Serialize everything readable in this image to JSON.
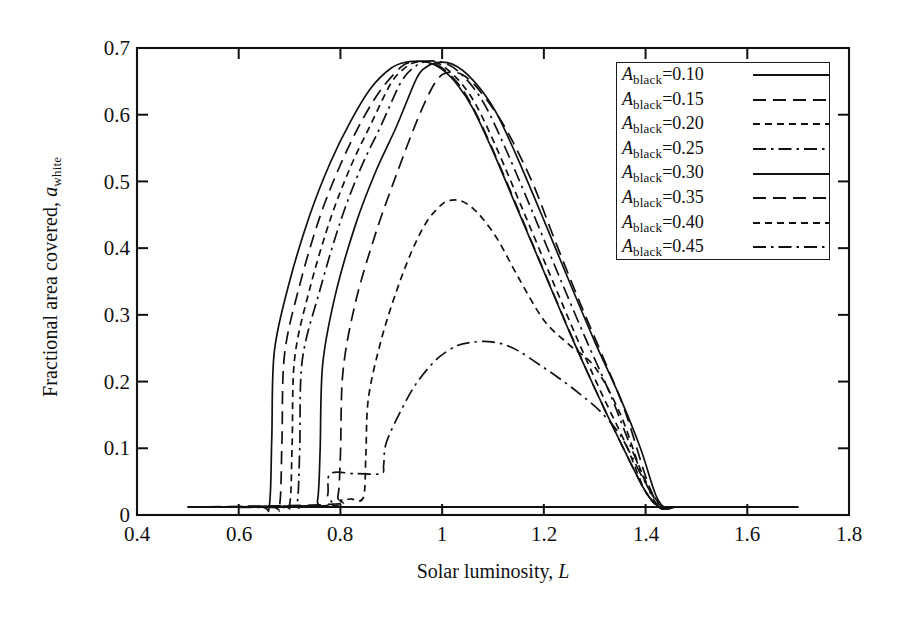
{
  "figure": {
    "background": "#ffffff",
    "ink": "#111111"
  },
  "axes": {
    "x": {
      "label_text": "Solar luminosity, ",
      "label_var": "L",
      "ticks": [
        "0.4",
        "0.6",
        "0.8",
        "1",
        "1.2",
        "1.4",
        "1.6",
        "1.8"
      ],
      "tick_values": [
        0.4,
        0.6,
        0.8,
        1.0,
        1.2,
        1.4,
        1.6,
        1.8
      ],
      "min": 0.4,
      "max": 1.8
    },
    "y": {
      "label_text": "Fractional area covered, ",
      "label_var": "a",
      "label_sub": "white",
      "ticks": [
        "0.7",
        "0.6",
        "0.5",
        "0.4",
        "0.3",
        "0.2",
        "0.1",
        "0"
      ],
      "tick_values": [
        0.7,
        0.6,
        0.5,
        0.4,
        0.3,
        0.2,
        0.1,
        0.0
      ],
      "min": 0.0,
      "max": 0.7
    }
  },
  "legend": {
    "position": "top-right-inside",
    "items": [
      {
        "prefix": "A",
        "sub": "black",
        "eq": "=0.10",
        "dash": "solid"
      },
      {
        "prefix": "A",
        "sub": "black",
        "eq": "=0.15",
        "dash": "dashed"
      },
      {
        "prefix": "A",
        "sub": "black",
        "eq": "=0.20",
        "dash": "dotted-dash"
      },
      {
        "prefix": "A",
        "sub": "black",
        "eq": "=0.25",
        "dash": "dash-dot"
      },
      {
        "prefix": "A",
        "sub": "black",
        "eq": "=0.30",
        "dash": "solid"
      },
      {
        "prefix": "A",
        "sub": "black",
        "eq": "=0.35",
        "dash": "dashed"
      },
      {
        "prefix": "A",
        "sub": "black",
        "eq": "=0.40",
        "dash": "dotted-dash"
      },
      {
        "prefix": "A",
        "sub": "black",
        "eq": "=0.45",
        "dash": "dash-dot"
      }
    ]
  },
  "chart_data": {
    "type": "line",
    "title": "",
    "xlabel": "Solar luminosity, L",
    "ylabel": "Fractional area covered, a_white",
    "xlim": [
      0.4,
      1.8
    ],
    "ylim": [
      0.0,
      0.7
    ],
    "grid": false,
    "legend_position": "upper right",
    "x_ticks": [
      0.4,
      0.6,
      0.8,
      1.0,
      1.2,
      1.4,
      1.6,
      1.8
    ],
    "y_ticks": [
      0.0,
      0.1,
      0.2,
      0.3,
      0.4,
      0.5,
      0.6,
      0.7
    ],
    "series": [
      {
        "name": "A_black=0.10",
        "dash": "solid",
        "x": [
          0.5,
          0.64,
          0.66,
          0.665,
          0.67,
          0.7,
          0.74,
          0.78,
          0.82,
          0.86,
          0.9,
          0.93,
          0.95,
          0.97,
          1.0,
          1.03,
          1.06,
          1.1,
          1.15,
          1.2,
          1.25,
          1.3,
          1.35,
          1.4,
          1.43,
          1.45,
          1.5,
          1.6,
          1.7
        ],
        "y": [
          0.012,
          0.012,
          0.013,
          0.115,
          0.245,
          0.35,
          0.45,
          0.528,
          0.59,
          0.64,
          0.67,
          0.679,
          0.68,
          0.679,
          0.668,
          0.645,
          0.61,
          0.545,
          0.455,
          0.365,
          0.275,
          0.19,
          0.11,
          0.035,
          0.01,
          0.012,
          0.012,
          0.012,
          0.012
        ]
      },
      {
        "name": "A_black=0.15",
        "dash": "dashed",
        "x": [
          0.5,
          0.66,
          0.68,
          0.685,
          0.69,
          0.72,
          0.76,
          0.8,
          0.84,
          0.88,
          0.92,
          0.94,
          0.96,
          0.98,
          1.0,
          1.03,
          1.06,
          1.1,
          1.15,
          1.2,
          1.25,
          1.3,
          1.35,
          1.4,
          1.43,
          1.45,
          1.5,
          1.6,
          1.7
        ],
        "y": [
          0.012,
          0.012,
          0.013,
          0.11,
          0.24,
          0.345,
          0.448,
          0.525,
          0.588,
          0.638,
          0.672,
          0.679,
          0.68,
          0.678,
          0.67,
          0.648,
          0.612,
          0.547,
          0.457,
          0.366,
          0.276,
          0.19,
          0.11,
          0.035,
          0.01,
          0.012,
          0.012,
          0.012,
          0.012
        ]
      },
      {
        "name": "A_black=0.20",
        "dash": "dotted-dash",
        "x": [
          0.5,
          0.68,
          0.7,
          0.705,
          0.71,
          0.74,
          0.78,
          0.82,
          0.86,
          0.9,
          0.93,
          0.95,
          0.97,
          0.99,
          1.01,
          1.04,
          1.07,
          1.11,
          1.16,
          1.21,
          1.26,
          1.31,
          1.36,
          1.4,
          1.43,
          1.45,
          1.5,
          1.6,
          1.7
        ],
        "y": [
          0.012,
          0.013,
          0.015,
          0.105,
          0.235,
          0.34,
          0.443,
          0.522,
          0.586,
          0.648,
          0.672,
          0.679,
          0.68,
          0.678,
          0.668,
          0.645,
          0.61,
          0.545,
          0.455,
          0.364,
          0.274,
          0.188,
          0.108,
          0.035,
          0.01,
          0.012,
          0.012,
          0.012,
          0.012
        ]
      },
      {
        "name": "A_black=0.25",
        "dash": "dash-dot",
        "x": [
          0.5,
          0.7,
          0.715,
          0.72,
          0.725,
          0.76,
          0.8,
          0.84,
          0.88,
          0.92,
          0.95,
          0.97,
          0.99,
          1.01,
          1.03,
          1.06,
          1.09,
          1.13,
          1.18,
          1.23,
          1.28,
          1.33,
          1.37,
          1.41,
          1.43,
          1.45,
          1.5,
          1.6,
          1.7
        ],
        "y": [
          0.012,
          0.013,
          0.018,
          0.1,
          0.232,
          0.338,
          0.44,
          0.52,
          0.584,
          0.65,
          0.674,
          0.68,
          0.68,
          0.676,
          0.666,
          0.642,
          0.606,
          0.54,
          0.45,
          0.358,
          0.268,
          0.182,
          0.104,
          0.032,
          0.01,
          0.012,
          0.012,
          0.012,
          0.012
        ]
      },
      {
        "name": "A_black=0.30",
        "dash": "solid",
        "x": [
          0.5,
          0.74,
          0.755,
          0.76,
          0.765,
          0.79,
          0.83,
          0.87,
          0.91,
          0.95,
          0.97,
          0.99,
          1.01,
          1.03,
          1.05,
          1.08,
          1.11,
          1.15,
          1.2,
          1.25,
          1.3,
          1.35,
          1.39,
          1.42,
          1.44,
          1.46,
          1.5,
          1.6,
          1.7
        ],
        "y": [
          0.012,
          0.014,
          0.022,
          0.095,
          0.225,
          0.33,
          0.436,
          0.516,
          0.582,
          0.655,
          0.672,
          0.678,
          0.678,
          0.672,
          0.66,
          0.634,
          0.598,
          0.532,
          0.442,
          0.35,
          0.26,
          0.176,
          0.1,
          0.03,
          0.01,
          0.012,
          0.012,
          0.012,
          0.012
        ]
      },
      {
        "name": "A_black=0.35",
        "dash": "dashed",
        "x": [
          0.5,
          0.78,
          0.795,
          0.8,
          0.805,
          0.83,
          0.87,
          0.91,
          0.95,
          0.98,
          1.0,
          1.02,
          1.04,
          1.06,
          1.08,
          1.11,
          1.14,
          1.18,
          1.22,
          1.27,
          1.32,
          1.36,
          1.4,
          1.42,
          1.44,
          1.46,
          1.5,
          1.6,
          1.7
        ],
        "y": [
          0.012,
          0.016,
          0.028,
          0.09,
          0.215,
          0.32,
          0.424,
          0.51,
          0.59,
          0.64,
          0.66,
          0.664,
          0.66,
          0.648,
          0.63,
          0.598,
          0.558,
          0.494,
          0.415,
          0.32,
          0.23,
          0.155,
          0.058,
          0.022,
          0.01,
          0.012,
          0.012,
          0.012,
          0.012
        ]
      },
      {
        "name": "A_black=0.40",
        "dash": "dotted-dash",
        "x": [
          0.5,
          0.78,
          0.8,
          0.82,
          0.845,
          0.85,
          0.855,
          0.88,
          0.91,
          0.94,
          0.97,
          1.0,
          1.02,
          1.04,
          1.06,
          1.08,
          1.11,
          1.15,
          1.2,
          1.25,
          1.3,
          1.35,
          1.39,
          1.42,
          1.44,
          1.46,
          1.5,
          1.6,
          1.7
        ],
        "y": [
          0.012,
          0.014,
          0.022,
          0.024,
          0.026,
          0.09,
          0.175,
          0.262,
          0.335,
          0.395,
          0.44,
          0.466,
          0.472,
          0.47,
          0.46,
          0.444,
          0.412,
          0.356,
          0.292,
          0.255,
          0.222,
          0.152,
          0.068,
          0.024,
          0.01,
          0.012,
          0.012,
          0.012,
          0.012
        ]
      },
      {
        "name": "A_black=0.45",
        "dash": "dash-dot",
        "x": [
          0.5,
          0.76,
          0.775,
          0.78,
          0.83,
          0.88,
          0.885,
          0.89,
          0.92,
          0.95,
          0.99,
          1.03,
          1.06,
          1.09,
          1.12,
          1.15,
          1.19,
          1.23,
          1.27,
          1.31,
          1.35,
          1.39,
          1.42,
          1.44,
          1.46,
          1.5,
          1.6,
          1.7
        ],
        "y": [
          0.012,
          0.013,
          0.03,
          0.062,
          0.062,
          0.062,
          0.075,
          0.108,
          0.158,
          0.198,
          0.234,
          0.254,
          0.259,
          0.26,
          0.256,
          0.246,
          0.226,
          0.205,
          0.182,
          0.156,
          0.12,
          0.062,
          0.022,
          0.01,
          0.012,
          0.012,
          0.012,
          0.012
        ]
      },
      {
        "name": "baseline",
        "dash": "solid",
        "x": [
          0.5,
          0.7,
          0.9,
          1.1,
          1.3,
          1.5,
          1.7
        ],
        "y": [
          0.012,
          0.012,
          0.012,
          0.012,
          0.012,
          0.012,
          0.012
        ]
      }
    ]
  },
  "plot_box": {
    "left_px": 137,
    "right_px": 849,
    "top_px": 48,
    "bottom_px": 515
  }
}
